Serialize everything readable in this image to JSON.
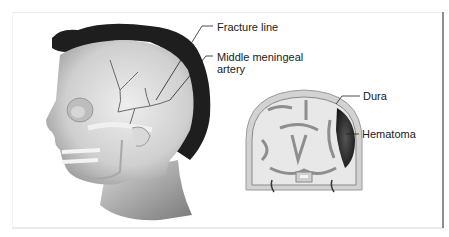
{
  "figure": {
    "panels": [
      {
        "id": "head-lateral-view",
        "description": "Lateral view of head with skull exposed"
      },
      {
        "id": "coronal-section",
        "description": "Coronal cross-section of brain"
      }
    ],
    "labels": {
      "fracture_line": "Fracture line",
      "middle_meningeal_line1": "Middle meningeal",
      "middle_meningeal_line2": "artery",
      "dura": "Dura",
      "hematoma": "Hematoma"
    },
    "colors": {
      "hair": "#1e1e1e",
      "skin": "#c8c8c8",
      "bone": "#e2e2e2",
      "hematoma": "#2a2a2a",
      "leader": "#222222",
      "border_right": "#8f8f8f"
    }
  }
}
